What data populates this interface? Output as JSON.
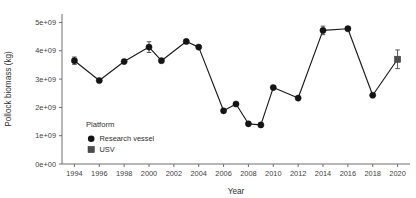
{
  "chart_data": {
    "type": "line",
    "title": "",
    "xlabel": "Year",
    "ylabel": "Pollock biomass (kg)",
    "xlim": [
      1993,
      2021
    ],
    "ylim": [
      0,
      5300000000.0
    ],
    "grid": false,
    "x_ticks": [
      1994,
      1996,
      1998,
      2000,
      2002,
      2004,
      2006,
      2008,
      2010,
      2012,
      2014,
      2016,
      2018,
      2020
    ],
    "x_tick_labels": [
      "1994",
      "1996",
      "1998",
      "2000",
      "2002",
      "2004",
      "2006",
      "2008",
      "2010",
      "2012",
      "2014",
      "2016",
      "2018",
      "2020"
    ],
    "y_ticks": [
      0,
      1000000000,
      2000000000,
      3000000000,
      4000000000,
      5000000000
    ],
    "y_tick_labels": [
      "0e+00",
      "1e+09",
      "2e+09",
      "3e+09",
      "4e+09",
      "5e+09"
    ],
    "legend": {
      "title": "Platform",
      "position": "inside-lower-left",
      "entries": [
        {
          "label": "Research vessel",
          "marker": "circle",
          "color": "#141414"
        },
        {
          "label": "USV",
          "marker": "square",
          "color": "#4d4d4d"
        }
      ]
    },
    "series": [
      {
        "name": "Research vessel",
        "marker": "circle",
        "points": [
          {
            "x": 1994,
            "y": 3650000000,
            "err": 130000000
          },
          {
            "x": 1996,
            "y": 2950000000,
            "err": 0
          },
          {
            "x": 1998,
            "y": 3620000000,
            "err": 0
          },
          {
            "x": 2000,
            "y": 4130000000,
            "err": 190000000
          },
          {
            "x": 2001,
            "y": 3650000000,
            "err": 0
          },
          {
            "x": 2003,
            "y": 4330000000,
            "err": 0
          },
          {
            "x": 2004,
            "y": 4130000000,
            "err": 0
          },
          {
            "x": 2006,
            "y": 1880000000,
            "err": 0
          },
          {
            "x": 2007,
            "y": 2120000000,
            "err": 0
          },
          {
            "x": 2008,
            "y": 1420000000,
            "err": 0
          },
          {
            "x": 2009,
            "y": 1380000000,
            "err": 0
          },
          {
            "x": 2010,
            "y": 2700000000,
            "err": 0
          },
          {
            "x": 2012,
            "y": 2330000000,
            "err": 0
          },
          {
            "x": 2014,
            "y": 4720000000,
            "err": 150000000
          },
          {
            "x": 2016,
            "y": 4780000000,
            "err": 0
          },
          {
            "x": 2018,
            "y": 2430000000,
            "err": 0
          }
        ]
      },
      {
        "name": "USV",
        "marker": "square",
        "points": [
          {
            "x": 2020,
            "y": 3700000000,
            "err": 330000000
          }
        ]
      }
    ]
  }
}
